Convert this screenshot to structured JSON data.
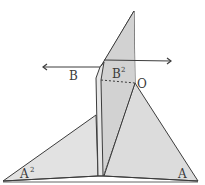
{
  "diagram": {
    "type": "folded-paper-geometry",
    "labels": {
      "B": "B",
      "B2": "B",
      "B2_sup": "2",
      "O": "O",
      "A2": "A",
      "A2_sup": "2",
      "A": "A"
    },
    "colors": {
      "paper": "#d9d9d9",
      "paper_light": "#e4e4e4",
      "stroke": "#3c3c3c"
    },
    "arrows": [
      {
        "name": "arrow-left",
        "direction": "left"
      },
      {
        "name": "arrow-right",
        "direction": "right"
      }
    ]
  }
}
